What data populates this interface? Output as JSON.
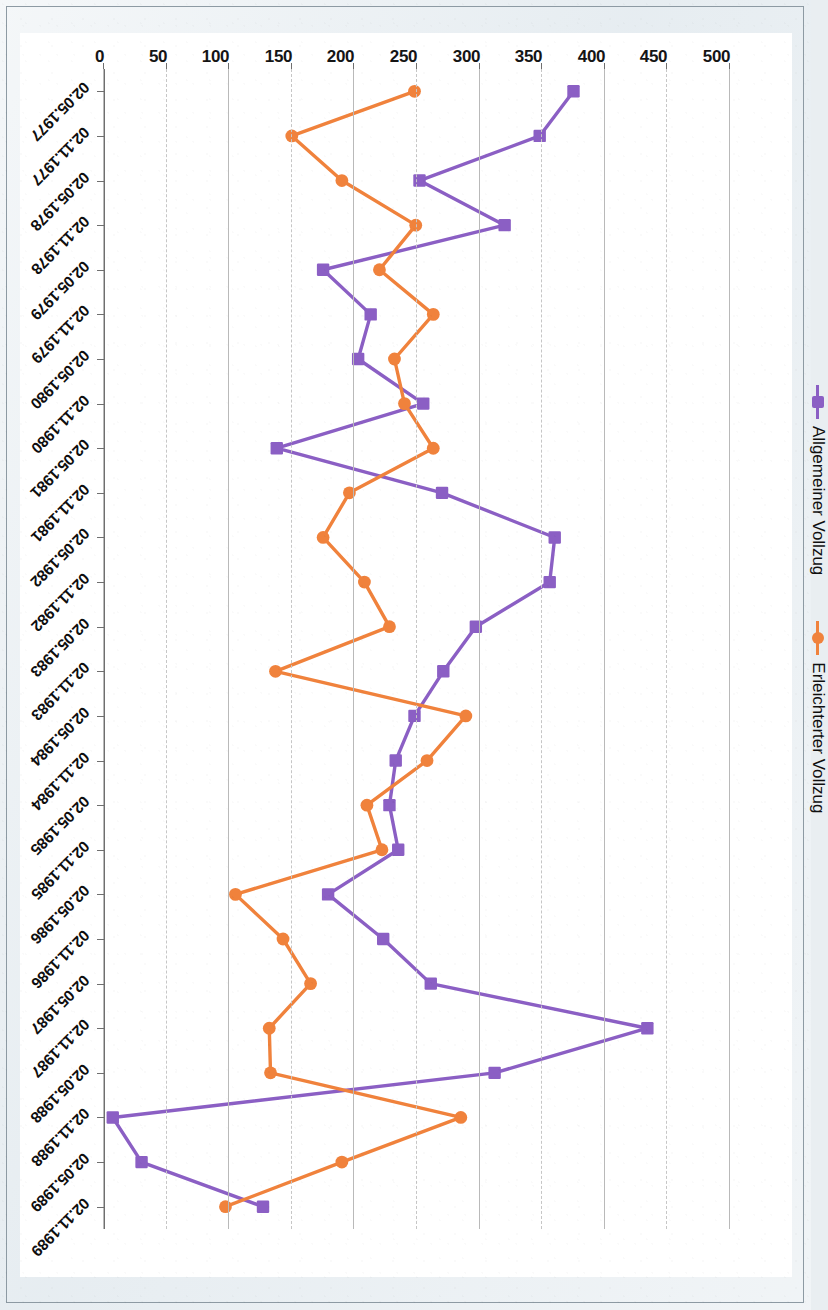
{
  "chart_data": {
    "type": "line",
    "title": "",
    "xlabel": "",
    "ylabel": "",
    "orientation": "page-rotated-90-ccw",
    "grid": true,
    "legend_position": "top-left",
    "ylim": [
      0,
      500
    ],
    "yticks": [
      0,
      50,
      100,
      150,
      200,
      250,
      300,
      350,
      400,
      450,
      500
    ],
    "ytick_labels": [
      "0",
      "50",
      "100",
      "150",
      "200",
      "250",
      "300",
      "350",
      "400",
      "450",
      "500"
    ],
    "categories": [
      "02.05.1977",
      "02.11.1977",
      "02.05.1978",
      "02.11.1978",
      "02.05.1979",
      "02.11.1979",
      "02.05.1980",
      "02.11.1980",
      "02.05.1981",
      "02.11.1981",
      "02.05.1982",
      "02.11.1982",
      "02.05.1983",
      "02.11.1983",
      "02.05.1984",
      "02.11.1984",
      "02.05.1985",
      "02.11.1985",
      "02.05.1986",
      "02.11.1986",
      "02.05.1987",
      "02.11.1987",
      "02.05.1988",
      "02.11.1988",
      "02.05.1989",
      "02.11.1989"
    ],
    "series": [
      {
        "name": "Allgemeiner Vollzug",
        "color": "#8b5fc4",
        "marker": "square",
        "values": [
          375,
          348,
          252,
          320,
          175,
          213,
          203,
          255,
          138,
          270,
          360,
          356,
          297,
          271,
          248,
          233,
          228,
          235,
          179,
          223,
          261,
          434,
          312,
          7,
          30,
          127
        ]
      },
      {
        "name": "Erleichterter Vollzug",
        "color": "#f0823c",
        "marker": "circle",
        "values": [
          248,
          150,
          190,
          249,
          220,
          263,
          232,
          240,
          263,
          196,
          175,
          208,
          228,
          137,
          289,
          258,
          210,
          222,
          105,
          143,
          165,
          132,
          133,
          285,
          190,
          97
        ]
      }
    ]
  },
  "legend": {
    "items": [
      {
        "label": "Allgemeiner Vollzug",
        "color": "#8b5fc4",
        "marker": "square"
      },
      {
        "label": "Erleichterter Vollzug",
        "color": "#f0823c",
        "marker": "circle"
      }
    ]
  },
  "colors": {
    "page_background": "#e7edf1",
    "plot_background": "#ffffff",
    "gridline": "#b9b9b9",
    "axis": "#6f6f6f",
    "series_general": "#8b5fc4",
    "series_relaxed": "#f0823c"
  }
}
